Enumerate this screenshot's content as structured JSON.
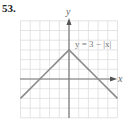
{
  "problem_number": "53.",
  "chart_data": {
    "type": "line",
    "title": "",
    "equation_label": "y = 3 − |x|",
    "xlabel": "x",
    "ylabel": "y",
    "xlim": [
      -5,
      5
    ],
    "ylim": [
      -4,
      6
    ],
    "grid": true,
    "series": [
      {
        "name": "y = 3 − |x|",
        "x": [
          -5,
          -3,
          0,
          3,
          5
        ],
        "y": [
          -2,
          0,
          3,
          0,
          -2
        ]
      }
    ]
  },
  "colors": {
    "grid": "#dddddd",
    "axis": "#777777",
    "curve": "#8a8a8a"
  }
}
